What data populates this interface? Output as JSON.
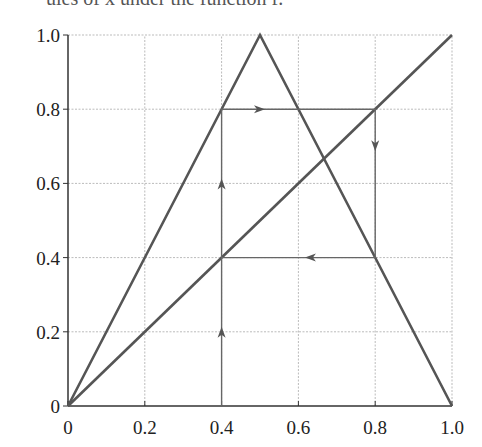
{
  "caption": "ules of x under the function f.",
  "chart_data": {
    "type": "line",
    "title": "",
    "xlabel": "",
    "ylabel": "",
    "xlim": [
      0,
      1
    ],
    "ylim": [
      0,
      1
    ],
    "grid": true,
    "x_ticks": [
      "0",
      "0.2",
      "0.4",
      "0.6",
      "0.8",
      "1.0"
    ],
    "y_ticks": [
      "0",
      "0.2",
      "0.4",
      "0.6",
      "0.8",
      "1.0"
    ],
    "series": [
      {
        "name": "tent map f(x)",
        "x": [
          0,
          0.5,
          1
        ],
        "y": [
          0,
          1,
          0
        ]
      },
      {
        "name": "identity y = x",
        "x": [
          0,
          1
        ],
        "y": [
          0,
          1
        ]
      },
      {
        "name": "cobweb orbit",
        "x": [
          0.4,
          0.4,
          0.8,
          0.8,
          0.4,
          0.4
        ],
        "y": [
          0,
          0.8,
          0.8,
          0.4,
          0.4,
          0.8
        ]
      }
    ],
    "annotations": [
      {
        "type": "arrow",
        "at": [
          0.4,
          0.2
        ],
        "direction": "up"
      },
      {
        "type": "arrow",
        "at": [
          0.4,
          0.6
        ],
        "direction": "up"
      },
      {
        "type": "arrow",
        "at": [
          0.5,
          0.8
        ],
        "direction": "right"
      },
      {
        "type": "arrow",
        "at": [
          0.8,
          0.7
        ],
        "direction": "down"
      },
      {
        "type": "arrow",
        "at": [
          0.63,
          0.4
        ],
        "direction": "left"
      }
    ]
  }
}
